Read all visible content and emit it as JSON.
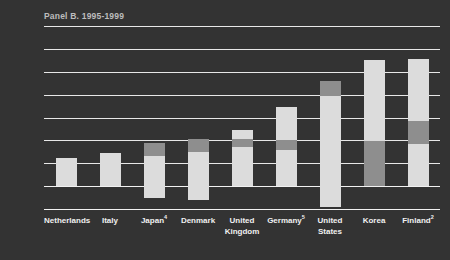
{
  "chart_data": {
    "type": "bar",
    "title": "Panel B. 1995-1999",
    "xlabel": "",
    "ylabel": "",
    "ylim": [
      -0.5,
      3.5
    ],
    "yticks": [
      "3.5",
      "3.0",
      "2.5",
      "2.0",
      "1.5",
      "1.0",
      "0.5",
      "0.0",
      "-0.5"
    ],
    "ytick_values": [
      3.5,
      3.0,
      2.5,
      2.0,
      1.5,
      1.0,
      0.5,
      0.0,
      -0.5
    ],
    "grid": true,
    "legend": "none",
    "stacked": true,
    "categories": [
      "Netherlands",
      "Italy",
      "Japan",
      "Denmark",
      "United Kingdom",
      "Germany",
      "United States",
      "Korea",
      "Finland"
    ],
    "category_footnotes": [
      "",
      "",
      "4",
      "",
      "",
      "5",
      "",
      "",
      "2"
    ],
    "series": [
      {
        "name": "light-segment",
        "color": "#dcdcdc",
        "values": [
          0.62,
          0.72,
          0.95,
          1.02,
          1.22,
          1.72,
          2.3,
          2.75,
          2.78
        ]
      },
      {
        "name": "grey-segment",
        "color": "#8e8e8e",
        "values": [
          0.0,
          0.0,
          0.3,
          0.28,
          0.16,
          0.2,
          0.33,
          0.98,
          1.42
        ]
      }
    ],
    "bars": [
      {
        "category": "Netherlands",
        "footnote": "",
        "total_top": 0.62,
        "bottom": 0.0,
        "segments": [
          {
            "type": "light",
            "from": 0.0,
            "to": 0.62
          }
        ]
      },
      {
        "category": "Italy",
        "footnote": "",
        "total_top": 0.72,
        "bottom": 0.0,
        "segments": [
          {
            "type": "light",
            "from": 0.0,
            "to": 0.72
          }
        ]
      },
      {
        "category": "Japan",
        "footnote": "4",
        "total_top": 0.95,
        "bottom": -0.26,
        "segments": [
          {
            "type": "light",
            "from": -0.26,
            "to": 0.65
          },
          {
            "type": "grey",
            "from": 0.65,
            "to": 0.95
          }
        ]
      },
      {
        "category": "Denmark",
        "footnote": "",
        "total_top": 1.02,
        "bottom": -0.3,
        "segments": [
          {
            "type": "light",
            "from": -0.3,
            "to": 0.74
          },
          {
            "type": "grey",
            "from": 0.74,
            "to": 1.02
          }
        ]
      },
      {
        "category": "United Kingdom",
        "footnote": "",
        "total_top": 1.22,
        "bottom": 0.0,
        "segments": [
          {
            "type": "light",
            "from": 0.0,
            "to": 0.86
          },
          {
            "type": "grey",
            "from": 0.86,
            "to": 1.02
          },
          {
            "type": "light",
            "from": 1.02,
            "to": 1.22
          }
        ]
      },
      {
        "category": "Germany",
        "footnote": "5",
        "total_top": 1.72,
        "bottom": 0.0,
        "segments": [
          {
            "type": "light",
            "from": 0.0,
            "to": 0.8
          },
          {
            "type": "grey",
            "from": 0.8,
            "to": 1.0
          },
          {
            "type": "light",
            "from": 1.0,
            "to": 1.72
          }
        ]
      },
      {
        "category": "United States",
        "footnote": "",
        "total_top": 2.3,
        "bottom": -0.45,
        "segments": [
          {
            "type": "light",
            "from": -0.45,
            "to": 1.97
          },
          {
            "type": "grey",
            "from": 1.97,
            "to": 2.3
          }
        ]
      },
      {
        "category": "Korea",
        "footnote": "",
        "total_top": 2.75,
        "bottom": 0.0,
        "segments": [
          {
            "type": "grey",
            "from": 0.0,
            "to": 0.98
          },
          {
            "type": "light",
            "from": 0.98,
            "to": 2.75
          }
        ]
      },
      {
        "category": "Finland",
        "footnote": "2",
        "total_top": 2.78,
        "bottom": 0.0,
        "segments": [
          {
            "type": "light",
            "from": 0.0,
            "to": 0.92
          },
          {
            "type": "grey",
            "from": 0.92,
            "to": 1.42
          },
          {
            "type": "light",
            "from": 1.42,
            "to": 2.78
          }
        ]
      }
    ]
  },
  "colors": {
    "background": "#333333",
    "gridline": "#e8e8e8",
    "axis_text": "#e6e6e6",
    "title_text": "#bdbdbd",
    "bar_light": "#dcdcdc",
    "bar_grey": "#8e8e8e"
  }
}
